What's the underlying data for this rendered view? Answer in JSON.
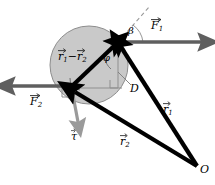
{
  "figure": {
    "colors": {
      "disc_fill": "#c9c9c9",
      "disc_stroke": "#8a8a8a",
      "vector_black": "#000000",
      "force_gray": "#6b6b6b",
      "torque_gray": "#9a9a9a",
      "dashed_gray": "#9a9a9a",
      "thin_gray": "#8f8f8f",
      "background": "#ffffff"
    },
    "labels": {
      "r_diff": {
        "base": "r",
        "sub1": "1",
        "op": "−",
        "base2": "r",
        "sub2": "2"
      },
      "force1": {
        "base": "F",
        "sub": "1"
      },
      "force2": {
        "base": "F",
        "sub": "2"
      },
      "torque": {
        "base": "τ"
      },
      "r1": {
        "base": "r",
        "sub": "1"
      },
      "r2": {
        "base": "r",
        "sub": "2"
      },
      "beta": "β",
      "phi": "φ",
      "lever_arm": "D",
      "origin": "O"
    },
    "geometry": {
      "disc": {
        "cx": 89,
        "cy": 65,
        "r": 39
      },
      "vertex_top": {
        "x": 118,
        "y": 42
      },
      "vertex_left": {
        "x": 70,
        "y": 88
      },
      "origin_point": {
        "x": 197,
        "y": 166
      },
      "force1_tip": {
        "x": 208,
        "y": 42
      },
      "force2_tip": {
        "x": 5,
        "y": 86
      },
      "torque_tip": {
        "x": 79,
        "y": 129
      },
      "dashed_tip": {
        "x": 149,
        "y": 7
      }
    }
  }
}
